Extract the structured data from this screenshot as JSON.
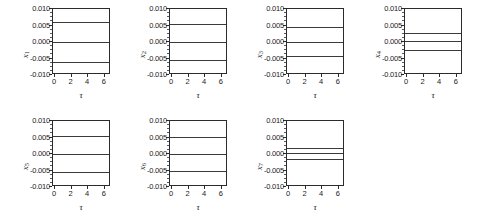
{
  "figure": {
    "background": "#ffffff",
    "line_color": "#3a3a3a",
    "axis_color": "#2b2b2b",
    "rows": 2,
    "columns": 4
  },
  "chart_data": [
    {
      "type": "line",
      "title": "",
      "xlabel": "τ",
      "ylabel": "x",
      "ylabel_sub": "1",
      "xlim": [
        -0.25,
        6.75
      ],
      "ylim": [
        -0.01,
        0.01
      ],
      "xticks": [
        0,
        2,
        4,
        6
      ],
      "xticklabels": [
        "0",
        "2",
        "4",
        "6"
      ],
      "yticks": [
        0.01,
        0.005,
        0.0,
        -0.005,
        -0.01
      ],
      "yticklabels": [
        "0.010",
        "0.005",
        "0.000",
        "-0.005",
        "-0.010"
      ],
      "grid": false,
      "legend": "none",
      "x": [
        0,
        1,
        2,
        3,
        4,
        5,
        6,
        6.5
      ],
      "series": [
        {
          "name": "upper",
          "values": [
            0.0062,
            0.0062,
            0.0062,
            0.0062,
            0.0062,
            0.0062,
            0.0062,
            0.0062
          ],
          "width": 1.6
        },
        {
          "name": "middle",
          "values": [
            0.0,
            0.0,
            0.0,
            0.0,
            0.0,
            0.0,
            0.0,
            0.0
          ],
          "width": 0.9
        },
        {
          "name": "lower",
          "values": [
            -0.006,
            -0.006,
            -0.006,
            -0.006,
            -0.006,
            -0.006,
            -0.006,
            -0.006
          ],
          "width": 1.6
        }
      ]
    },
    {
      "type": "line",
      "title": "",
      "xlabel": "τ",
      "ylabel": "x",
      "ylabel_sub": "2",
      "xlim": [
        -0.25,
        6.75
      ],
      "ylim": [
        -0.01,
        0.01
      ],
      "xticks": [
        0,
        2,
        4,
        6
      ],
      "xticklabels": [
        "0",
        "2",
        "4",
        "6"
      ],
      "yticks": [
        0.01,
        0.005,
        0.0,
        -0.005,
        -0.01
      ],
      "yticklabels": [
        "0.010",
        "0.005",
        "0.000",
        "-0.005",
        "-0.010"
      ],
      "grid": false,
      "legend": "none",
      "x": [
        0,
        1,
        2,
        3,
        4,
        5,
        6,
        6.5
      ],
      "series": [
        {
          "name": "upper",
          "values": [
            0.0055,
            0.0055,
            0.0055,
            0.0055,
            0.0055,
            0.0055,
            0.0055,
            0.0055
          ],
          "width": 1.6
        },
        {
          "name": "middle",
          "values": [
            0.0,
            0.0,
            0.0,
            0.0,
            0.0,
            0.0,
            0.0,
            0.0
          ],
          "width": 0.9
        },
        {
          "name": "lower",
          "values": [
            -0.0055,
            -0.0055,
            -0.0055,
            -0.0055,
            -0.0055,
            -0.0055,
            -0.0055,
            -0.0055
          ],
          "width": 1.6
        }
      ]
    },
    {
      "type": "line",
      "title": "",
      "xlabel": "τ",
      "ylabel": "x",
      "ylabel_sub": "3",
      "xlim": [
        -0.25,
        6.75
      ],
      "ylim": [
        -0.01,
        0.01
      ],
      "xticks": [
        0,
        2,
        4,
        6
      ],
      "xticklabels": [
        "0",
        "2",
        "4",
        "6"
      ],
      "yticks": [
        0.01,
        0.005,
        0.0,
        -0.005,
        -0.01
      ],
      "yticklabels": [
        "0.010",
        "0.005",
        "0.000",
        "-0.005",
        "-0.010"
      ],
      "grid": false,
      "legend": "none",
      "x": [
        0,
        1,
        2,
        3,
        4,
        5,
        6,
        6.5
      ],
      "series": [
        {
          "name": "upper",
          "values": [
            0.0044,
            0.0044,
            0.0045,
            0.0045,
            0.0045,
            0.0045,
            0.0046,
            0.0046
          ],
          "width": 1.6
        },
        {
          "name": "middle",
          "values": [
            0.0,
            0.0,
            0.0,
            0.0,
            0.0,
            0.0,
            0.0,
            0.0
          ],
          "width": 0.9
        },
        {
          "name": "lower",
          "values": [
            -0.0045,
            -0.0045,
            -0.0044,
            -0.0043,
            -0.0042,
            -0.0041,
            -0.004,
            -0.004
          ],
          "width": 1.6
        }
      ]
    },
    {
      "type": "line",
      "title": "",
      "xlabel": "τ",
      "ylabel": "x",
      "ylabel_sub": "4",
      "xlim": [
        -0.25,
        6.75
      ],
      "ylim": [
        -0.01,
        0.01
      ],
      "xticks": [
        0,
        2,
        4,
        6
      ],
      "xticklabels": [
        "0",
        "2",
        "4",
        "6"
      ],
      "yticks": [
        0.01,
        0.005,
        0.0,
        -0.005,
        -0.01
      ],
      "yticklabels": [
        "0.010",
        "0.005",
        "0.000",
        "-0.005",
        "-0.010"
      ],
      "grid": false,
      "legend": "none",
      "x": [
        0,
        1,
        2,
        3,
        4,
        5,
        6,
        6.5
      ],
      "series": [
        {
          "name": "upper",
          "values": [
            0.0027,
            0.0027,
            0.0027,
            0.0027,
            0.0027,
            0.0028,
            0.0028,
            0.0028
          ],
          "width": 1.6
        },
        {
          "name": "middle",
          "values": [
            0.0002,
            0.0002,
            0.0002,
            0.0002,
            0.0002,
            0.0002,
            0.0002,
            0.0002
          ],
          "width": 0.9
        },
        {
          "name": "lower",
          "values": [
            -0.0023,
            -0.0023,
            -0.0023,
            -0.0023,
            -0.0023,
            -0.0023,
            -0.0023,
            -0.0023
          ],
          "width": 1.6
        }
      ]
    },
    {
      "type": "line",
      "title": "",
      "xlabel": "τ",
      "ylabel": "x",
      "ylabel_sub": "5",
      "xlim": [
        -0.25,
        6.75
      ],
      "ylim": [
        -0.01,
        0.01
      ],
      "xticks": [
        0,
        2,
        4,
        6
      ],
      "xticklabels": [
        "0",
        "2",
        "4",
        "6"
      ],
      "yticks": [
        0.01,
        0.005,
        0.0,
        -0.005,
        -0.01
      ],
      "yticklabels": [
        "0.010",
        "0.005",
        "0.000",
        "-0.005",
        "-0.010"
      ],
      "grid": false,
      "legend": "none",
      "x": [
        0,
        1,
        2,
        3,
        4,
        5,
        6,
        6.5
      ],
      "series": [
        {
          "name": "upper",
          "values": [
            0.0056,
            0.0056,
            0.0056,
            0.0056,
            0.0056,
            0.0056,
            0.0056,
            0.0056
          ],
          "width": 1.6
        },
        {
          "name": "middle",
          "values": [
            0.0,
            0.0,
            0.0,
            0.0,
            0.0,
            0.0,
            0.0,
            0.0
          ],
          "width": 0.9
        },
        {
          "name": "lower",
          "values": [
            -0.0054,
            -0.0054,
            -0.0054,
            -0.0054,
            -0.0054,
            -0.0054,
            -0.0054,
            -0.0054
          ],
          "width": 1.6
        }
      ]
    },
    {
      "type": "line",
      "title": "",
      "xlabel": "τ",
      "ylabel": "x",
      "ylabel_sub": "6",
      "xlim": [
        -0.25,
        6.75
      ],
      "ylim": [
        -0.01,
        0.01
      ],
      "xticks": [
        0,
        2,
        4,
        6
      ],
      "xticklabels": [
        "0",
        "2",
        "4",
        "6"
      ],
      "yticks": [
        0.01,
        0.005,
        0.0,
        -0.005,
        -0.01
      ],
      "yticklabels": [
        "0.010",
        "0.005",
        "0.000",
        "-0.005",
        "-0.010"
      ],
      "grid": false,
      "legend": "none",
      "x": [
        0,
        1,
        2,
        3,
        4,
        5,
        6,
        6.5
      ],
      "series": [
        {
          "name": "upper",
          "values": [
            0.0051,
            0.0051,
            0.0051,
            0.0051,
            0.0051,
            0.0051,
            0.0051,
            0.0051
          ],
          "width": 1.6
        },
        {
          "name": "middle",
          "values": [
            0.0,
            0.0,
            0.0,
            0.0,
            0.0,
            0.0,
            0.0,
            0.0
          ],
          "width": 0.9
        },
        {
          "name": "lower",
          "values": [
            -0.005,
            -0.005,
            -0.005,
            -0.005,
            -0.005,
            -0.005,
            -0.005,
            -0.005
          ],
          "width": 1.6
        }
      ]
    },
    {
      "type": "line",
      "title": "",
      "xlabel": "τ",
      "ylabel": "x",
      "ylabel_sub": "7",
      "xlim": [
        -0.25,
        6.75
      ],
      "ylim": [
        -0.01,
        0.01
      ],
      "xticks": [
        0,
        2,
        4,
        6
      ],
      "xticklabels": [
        "0",
        "2",
        "4",
        "6"
      ],
      "yticks": [
        0.01,
        0.005,
        0.0,
        -0.005,
        -0.01
      ],
      "yticklabels": [
        "0.010",
        "0.005",
        "0.000",
        "-0.005",
        "-0.010"
      ],
      "grid": false,
      "legend": "none",
      "x": [
        0,
        1,
        2,
        3,
        4,
        5,
        6,
        6.5
      ],
      "series": [
        {
          "name": "upper",
          "values": [
            0.0018,
            0.0018,
            0.0018,
            0.0019,
            0.0019,
            0.0019,
            0.002,
            0.002
          ],
          "width": 1.6
        },
        {
          "name": "middle",
          "values": [
            0.0004,
            0.0004,
            0.0004,
            0.0004,
            0.0004,
            0.0004,
            0.0004,
            0.0004
          ],
          "width": 0.9
        },
        {
          "name": "lower",
          "values": [
            -0.0017,
            -0.0017,
            -0.0016,
            -0.0016,
            -0.0015,
            -0.0015,
            -0.0014,
            -0.0014
          ],
          "width": 1.6
        }
      ]
    }
  ]
}
